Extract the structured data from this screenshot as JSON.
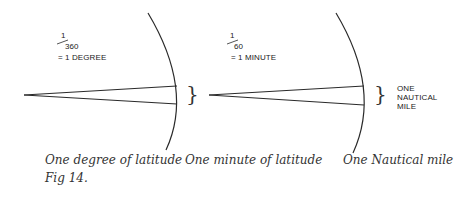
{
  "figure": {
    "label": "Fig 14.",
    "stroke_color": "#2a2a2a",
    "panels": [
      {
        "id": "degree",
        "fraction_numerator": "1",
        "fraction_denominator": "360",
        "equals_text": "= 1 DEGREE",
        "caption": "One degree of latitude"
      },
      {
        "id": "minute",
        "fraction_numerator": "1",
        "fraction_denominator": "60",
        "equals_text": "= 1 MINUTE",
        "caption": "One minute of latitude"
      },
      {
        "id": "nautical-mile",
        "side_label_lines": [
          "ONE",
          "NAUTICAL",
          "MILE"
        ],
        "caption": "One Nautical mile"
      }
    ],
    "brace_glyph": "}"
  }
}
